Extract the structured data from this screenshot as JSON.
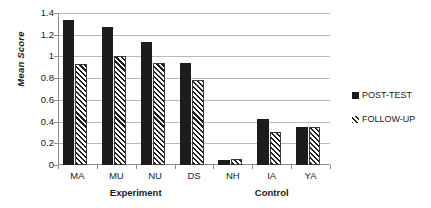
{
  "chart_data": {
    "type": "bar",
    "title": "",
    "xlabel": "",
    "ylabel": "Mean Score",
    "ylim": [
      0,
      1.4
    ],
    "yticks": [
      "0",
      "0.2",
      "0.4",
      "0.6",
      "0.8",
      "1",
      "1.2",
      "1.4"
    ],
    "ytick_values": [
      0,
      0.2,
      0.4,
      0.6,
      0.8,
      1.0,
      1.2,
      1.4
    ],
    "grid": "horizontal",
    "legend_position": "right",
    "categories": [
      "MA",
      "MU",
      "NU",
      "DS",
      "NH",
      "IA",
      "YA"
    ],
    "group_labels": [
      {
        "label": "Experiment",
        "categories": [
          "MA",
          "MU",
          "NU",
          "DS"
        ]
      },
      {
        "label": "Control",
        "categories": [
          "NH",
          "IA",
          "YA"
        ]
      }
    ],
    "series": [
      {
        "name": "POST-TEST",
        "style": "solid",
        "color": "#1c1c1c",
        "values": [
          1.34,
          1.27,
          1.13,
          0.94,
          0.05,
          0.42,
          0.35
        ]
      },
      {
        "name": "FOLLOW-UP",
        "style": "diagonal-hatch",
        "color": "#1c1c1c",
        "values": [
          0.93,
          1.0,
          0.94,
          0.78,
          0.06,
          0.3,
          0.35
        ]
      }
    ]
  },
  "legend": {
    "items": [
      {
        "label": "POST-TEST"
      },
      {
        "label": "FOLLOW-UP"
      }
    ]
  },
  "axis": {
    "y_title": "Mean Score"
  }
}
